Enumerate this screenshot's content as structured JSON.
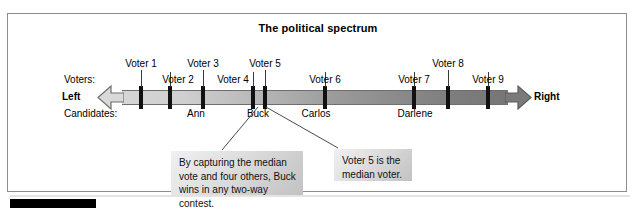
{
  "figure": {
    "title": "The political spectrum",
    "frame_border_color": "#8d8d8d",
    "background": "#ffffff"
  },
  "axis": {
    "left_end_label": "Left",
    "right_end_label": "Right",
    "row_label_voters": "Voters:",
    "row_label_candidates": "Candidates:",
    "gradient_from": "#d6d6d6",
    "gradient_to": "#767676",
    "tick_color": "#111111"
  },
  "voters": [
    {
      "label": "Voter 1",
      "row": "top",
      "tick_x": 141,
      "label_x": 141
    },
    {
      "label": "Voter 2",
      "row": "bottom",
      "tick_x": 170,
      "label_x": 178
    },
    {
      "label": "Voter 3",
      "row": "top",
      "tick_x": 203,
      "label_x": 203
    },
    {
      "label": "Voter 4",
      "row": "bottom",
      "tick_x": 253,
      "label_x": 233
    },
    {
      "label": "Voter 5",
      "row": "top",
      "tick_x": 265,
      "label_x": 265
    },
    {
      "label": "Voter 6",
      "row": "bottom",
      "tick_x": 325,
      "label_x": 325
    },
    {
      "label": "Voter 7",
      "row": "bottom",
      "tick_x": 414,
      "label_x": 414
    },
    {
      "label": "Voter 8",
      "row": "top",
      "tick_x": 448,
      "label_x": 448
    },
    {
      "label": "Voter 9",
      "row": "bottom",
      "tick_x": 488,
      "label_x": 488
    }
  ],
  "candidates": [
    {
      "name": "Ann",
      "x": 196
    },
    {
      "name": "Buck",
      "x": 258
    },
    {
      "name": "Carlos",
      "x": 316
    },
    {
      "name": "Darlene",
      "x": 415
    }
  ],
  "callouts": [
    {
      "id": "buck",
      "text": "By capturing the median vote and four others, Buck wins in any two-way contest."
    },
    {
      "id": "median-voter",
      "text": "Voter 5 is the median voter."
    }
  ]
}
